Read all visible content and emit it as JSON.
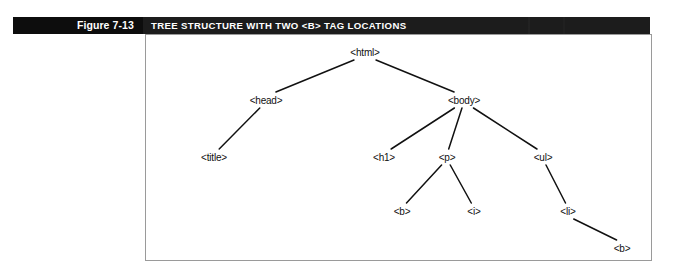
{
  "figure": {
    "number_label": "Figure 7-13",
    "title_label": "TREE STRUCTURE WITH TWO <B> TAG LOCATIONS",
    "number_block_color": "#0d0d0d",
    "title_block_color": "#1c1c1c",
    "text_color": "#ffffff"
  },
  "diagram": {
    "frame_border_color": "#9a9a9a",
    "frame_background": "#ffffff",
    "line_color": "#111111",
    "node_text_color": "#111111",
    "nodes": [
      {
        "id": "html",
        "label": "<html>",
        "x": 365,
        "y": 52,
        "depth": 0
      },
      {
        "id": "head",
        "label": "<head>",
        "x": 266,
        "y": 100,
        "depth": 1
      },
      {
        "id": "body",
        "label": "<body>",
        "x": 464,
        "y": 100,
        "depth": 1
      },
      {
        "id": "title",
        "label": "<title>",
        "x": 214,
        "y": 157,
        "depth": 2
      },
      {
        "id": "h1",
        "label": "<h1>",
        "x": 384,
        "y": 157,
        "depth": 2
      },
      {
        "id": "p",
        "label": "<p>",
        "x": 447,
        "y": 157,
        "depth": 2
      },
      {
        "id": "ul",
        "label": "<ul>",
        "x": 543,
        "y": 157,
        "depth": 2
      },
      {
        "id": "b1",
        "label": "<b>",
        "x": 402,
        "y": 211,
        "depth": 3
      },
      {
        "id": "i",
        "label": "<i>",
        "x": 474,
        "y": 211,
        "depth": 3
      },
      {
        "id": "li",
        "label": "<li>",
        "x": 568,
        "y": 211,
        "depth": 3
      },
      {
        "id": "b2",
        "label": "<b>",
        "x": 622,
        "y": 248,
        "depth": 4
      }
    ],
    "edges": [
      {
        "from": "html",
        "to": "head"
      },
      {
        "from": "html",
        "to": "body"
      },
      {
        "from": "head",
        "to": "title"
      },
      {
        "from": "body",
        "to": "h1"
      },
      {
        "from": "body",
        "to": "p"
      },
      {
        "from": "body",
        "to": "ul"
      },
      {
        "from": "p",
        "to": "b1"
      },
      {
        "from": "p",
        "to": "i"
      },
      {
        "from": "ul",
        "to": "li"
      },
      {
        "from": "li",
        "to": "b2"
      }
    ]
  }
}
